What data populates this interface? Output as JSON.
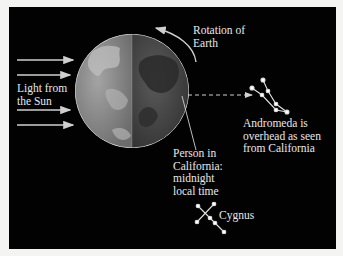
{
  "figure": {
    "labels": {
      "rotation": "Rotation of\nEarth",
      "sunlight": "Light from\nthe Sun",
      "person": "Person in\nCalifornia:\nmidnight\nlocal time",
      "andromeda": "Andromeda is\noverhead as seen\nfrom California",
      "cygnus": "Cygnus"
    },
    "colors": {
      "background": "#020202",
      "frame": "#f4f4f2",
      "text": "#e8e8e8",
      "arrow": "#cfcfcf",
      "day_side": "#8a8a8a",
      "night_side": "#4a4a4a"
    },
    "sun_arrows": 4
  }
}
